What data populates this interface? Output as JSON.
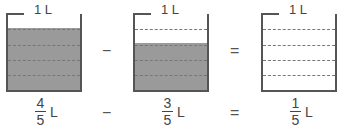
{
  "capacity_label": "1 L",
  "beakers": [
    {
      "fill_fifths": 4,
      "fraction": {
        "numerator": "4",
        "denominator": "5",
        "unit": "L"
      }
    },
    {
      "fill_fifths": 3,
      "fraction": {
        "numerator": "3",
        "denominator": "5",
        "unit": "L"
      }
    },
    {
      "fill_fifths": 0,
      "fraction": {
        "numerator": "1",
        "denominator": "5",
        "unit": "L"
      }
    }
  ],
  "operators": {
    "minus": "−",
    "equals": "="
  },
  "colors": {
    "water": "#9a9a9a",
    "outline": "#555555"
  }
}
